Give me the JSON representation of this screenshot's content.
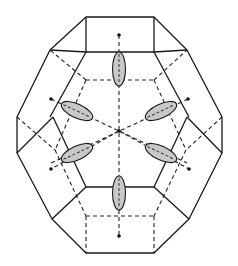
{
  "diagram": {
    "title": "",
    "colors": {
      "line": "#1a1a1a",
      "ellipse_fill": "#c8c8c8",
      "background": "#ffffff"
    },
    "center": [
      119,
      131
    ],
    "outer_outline": [
      [
        86,
        17
      ],
      [
        154,
        17
      ],
      [
        187,
        50
      ],
      [
        222,
        117
      ],
      [
        222,
        153
      ],
      [
        189,
        219
      ],
      [
        154,
        253
      ],
      [
        86,
        253
      ],
      [
        52,
        219
      ],
      [
        17,
        153
      ],
      [
        17,
        117
      ],
      [
        50,
        50
      ]
    ],
    "solid_edges": [
      [
        [
          86,
          17
        ],
        [
          86,
          52
        ]
      ],
      [
        [
          154,
          17
        ],
        [
          154,
          52
        ]
      ],
      [
        [
          86,
          52
        ],
        [
          154,
          52
        ]
      ],
      [
        [
          86,
          52
        ],
        [
          50,
          117
        ]
      ],
      [
        [
          154,
          52
        ],
        [
          189,
          117
        ]
      ],
      [
        [
          50,
          50
        ],
        [
          86,
          52
        ]
      ],
      [
        [
          187,
          50
        ],
        [
          154,
          52
        ]
      ],
      [
        [
          17,
          153
        ],
        [
          53,
          117
        ]
      ],
      [
        [
          222,
          153
        ],
        [
          187,
          117
        ]
      ],
      [
        [
          53,
          117
        ],
        [
          86,
          187
        ]
      ],
      [
        [
          187,
          117
        ],
        [
          154,
          187
        ]
      ],
      [
        [
          86,
          187
        ],
        [
          154,
          187
        ]
      ],
      [
        [
          86,
          187
        ],
        [
          52,
          219
        ]
      ],
      [
        [
          154,
          187
        ],
        [
          189,
          219
        ]
      ]
    ],
    "hidden_edges": [
      [
        [
          86,
          80
        ],
        [
          154,
          80
        ]
      ],
      [
        [
          86,
          80
        ],
        [
          50,
          50
        ]
      ],
      [
        [
          154,
          80
        ],
        [
          187,
          50
        ]
      ],
      [
        [
          86,
          80
        ],
        [
          55,
          150
        ]
      ],
      [
        [
          154,
          80
        ],
        [
          186,
          150
        ]
      ],
      [
        [
          17,
          117
        ],
        [
          55,
          150
        ]
      ],
      [
        [
          222,
          117
        ],
        [
          186,
          150
        ]
      ],
      [
        [
          55,
          150
        ],
        [
          86,
          216
        ]
      ],
      [
        [
          186,
          150
        ],
        [
          154,
          216
        ]
      ],
      [
        [
          86,
          216
        ],
        [
          154,
          216
        ]
      ],
      [
        [
          86,
          216
        ],
        [
          86,
          253
        ]
      ],
      [
        [
          154,
          216
        ],
        [
          154,
          253
        ]
      ]
    ],
    "axes": [
      {
        "from": [
          119,
          35
        ],
        "to": [
          119,
          236
        ]
      },
      {
        "from": [
          51,
          99
        ],
        "to": [
          187,
          163
        ]
      },
      {
        "from": [
          188,
          99
        ],
        "to": [
          51,
          163
        ]
      }
    ],
    "axis_endpoints": [
      [
        119,
        35
      ],
      [
        119,
        236
      ],
      [
        51,
        99
      ],
      [
        188,
        99
      ],
      [
        51,
        169
      ],
      [
        189,
        169
      ]
    ],
    "ellipsoids": [
      {
        "label": "top",
        "cx": 119,
        "cy": 69,
        "rx": 6.5,
        "ry": 17,
        "angle": 0
      },
      {
        "label": "bottom",
        "cx": 119,
        "cy": 193,
        "rx": 6.5,
        "ry": 17,
        "angle": 0
      },
      {
        "label": "upper-left",
        "cx": 77,
        "cy": 111,
        "rx": 17,
        "ry": 7,
        "angle": 25
      },
      {
        "label": "upper-right",
        "cx": 161,
        "cy": 111,
        "rx": 17,
        "ry": 7,
        "angle": -25
      },
      {
        "label": "lower-left",
        "cx": 77,
        "cy": 153,
        "rx": 17,
        "ry": 7,
        "angle": -25
      },
      {
        "label": "lower-right",
        "cx": 161,
        "cy": 153,
        "rx": 17,
        "ry": 7,
        "angle": 25
      }
    ]
  }
}
